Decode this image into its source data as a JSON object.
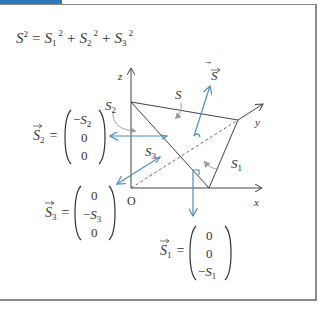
{
  "header": {
    "accent_color": "#2a78b8"
  },
  "formula": {
    "lhs": "S",
    "lhs_exp": "2",
    "eq": "=",
    "terms": [
      {
        "base": "S",
        "sub": "1",
        "exp": "2"
      },
      {
        "base": "S",
        "sub": "2",
        "exp": "2"
      },
      {
        "base": "S",
        "sub": "3",
        "exp": "2"
      }
    ],
    "plus": "+"
  },
  "diagram": {
    "axes": {
      "x": "x",
      "y": "y",
      "z": "z",
      "origin": "O"
    },
    "labels": {
      "S_vec": "S",
      "S": "S",
      "S1": "S",
      "S1_sub": "1",
      "S2": "S",
      "S2_sub": "2",
      "S3": "S",
      "S3_sub": "3"
    },
    "vector_color": "#4a8fc4",
    "line_color": "#444444"
  },
  "vectors": {
    "S2": {
      "name": "S",
      "sub": "2",
      "components": [
        "−S",
        "0",
        "0"
      ],
      "comp_subs": [
        "2",
        "",
        ""
      ]
    },
    "S3": {
      "name": "S",
      "sub": "3",
      "components": [
        "0",
        "−S",
        "0"
      ],
      "comp_subs": [
        "",
        "3",
        ""
      ]
    },
    "S1": {
      "name": "S",
      "sub": "1",
      "components": [
        "0",
        "0",
        "−S"
      ],
      "comp_subs": [
        "",
        "",
        "1"
      ]
    }
  }
}
